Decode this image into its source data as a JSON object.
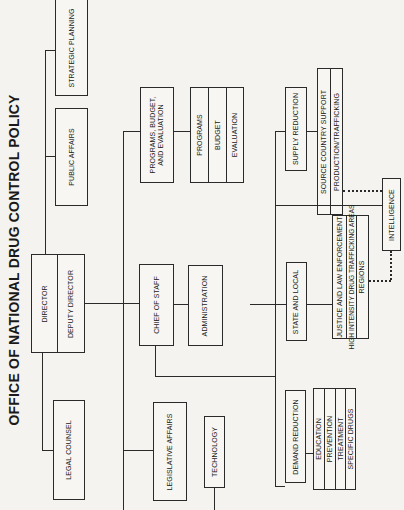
{
  "title": "OFFICE OF NATIONAL DRUG CONTROL POLICY",
  "nodes": {
    "strategic_planning": "STRATEGIC PLANNING",
    "public_affairs": "PUBLIC AFFAIRS",
    "director": "DIRECTOR",
    "deputy_director": "DEPUTY DIRECTOR",
    "legal_counsel": "LEGAL COUNSEL",
    "pbe": {
      "line1": "PROGRAMS, BUDGET,",
      "line2": "AND EVALUATION",
      "units": [
        "PROGRAMS",
        "BUDGET",
        "EVALUATION"
      ]
    },
    "chief_of_staff": "CHIEF OF STAFF",
    "administration": "ADMINISTRATION",
    "legislative_affairs": "LEGISLATIVE AFFAIRS",
    "technology": "TECHNOLOGY",
    "supply_reduction": {
      "label": "SUPPLY REDUCTION",
      "units": [
        "SOURCE COUNTRY SUPPORT",
        "PRODUCTION/TRAFFICKING"
      ]
    },
    "intelligence": "INTELLIGENCE",
    "state_and_local": {
      "label": "STATE AND LOCAL",
      "units": [
        "JUSTICE AND LAW ENFORCEMENT",
        "HIGH INTENSITY DRUG TRAFFICKING AREAS",
        "REGIONS"
      ]
    },
    "demand_reduction": {
      "label": "DEMAND REDUCTION",
      "units": [
        "EDUCATION",
        "PREVENTION",
        "TREATMENT",
        "SPECIFIC DRUGS"
      ]
    }
  }
}
